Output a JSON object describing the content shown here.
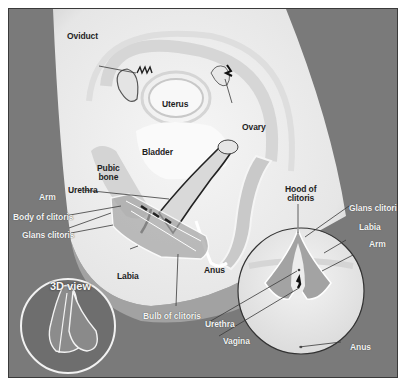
{
  "diagram": {
    "colors": {
      "background": "#7a7a7a",
      "body": "#ececec",
      "organ": "#f7f7f7",
      "tissue": "#b9b9b9",
      "outline": "#3a3a3a",
      "label_dark": "#1f1f1f",
      "label_light": "#f4f4f4"
    },
    "side_view_labels": {
      "oviduct": "Oviduct",
      "uterus": "Uterus",
      "ovary": "Ovary",
      "bladder": "Bladder",
      "pubic_bone": "Pubic\nbone",
      "urethra": "Urethra",
      "arm": "Arm",
      "body_of_clitoris": "Body of clitoris",
      "glans_clitoris": "Glans clitoris",
      "labia": "Labia",
      "anus": "Anus",
      "bulb_of_clitoris": "Bulb of clitoris"
    },
    "front_view_labels": {
      "hood_of_clitoris": "Hood of\nclitoris",
      "glans_clitoris": "Glans clitoris",
      "labia": "Labia",
      "arm": "Arm",
      "urethra": "Urethra",
      "vagina": "Vagina",
      "anus": "Anus"
    },
    "inset": {
      "title": "3D view"
    }
  }
}
